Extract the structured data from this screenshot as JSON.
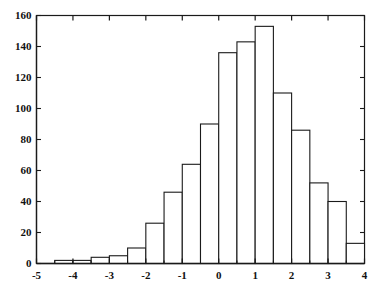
{
  "figure": {
    "title": "",
    "background_color": "#ffffff",
    "axis_color": "#1a1a1a",
    "bar_fill_color": "#ffffff",
    "bar_edge_color": "#1a1a1a",
    "tick_label_color": "#111111"
  },
  "chart_data": {
    "type": "bar",
    "chart_style": "histogram",
    "title": "",
    "subtitle": "",
    "xlabel": "",
    "ylabel": "",
    "xlim": [
      -5,
      4
    ],
    "ylim": [
      0,
      160
    ],
    "grid": false,
    "legend": false,
    "legend_entries": [],
    "annotations": [],
    "bin_width": 0.5,
    "xticks": [
      -5,
      -4,
      -3,
      -2,
      -1,
      0,
      1,
      2,
      3,
      4
    ],
    "xtick_labels": [
      "-5",
      "-4",
      "-3",
      "-2",
      "-1",
      "0",
      "1",
      "2",
      "3",
      "4"
    ],
    "yticks": [
      0,
      20,
      40,
      60,
      80,
      100,
      120,
      140,
      160
    ],
    "ytick_labels": [
      "0",
      "20",
      "40",
      "60",
      "80",
      "100",
      "120",
      "140",
      "160"
    ],
    "minor_xticks_per_major": 2,
    "bin_edges": [
      -4.5,
      -4.0,
      -3.5,
      -3.0,
      -2.5,
      -2.0,
      -1.5,
      -1.0,
      -0.5,
      0.0,
      0.5,
      1.0,
      1.5,
      2.0,
      2.5,
      3.0,
      3.5,
      4.0
    ],
    "categories": [
      "-4.5",
      "-4.0",
      "-3.5",
      "-3.0",
      "-2.5",
      "-2.0",
      "-1.5",
      "-1.0",
      "-0.5",
      "0.0",
      "0.5",
      "1.0",
      "1.5",
      "2.0",
      "2.5",
      "3.0",
      "3.5"
    ],
    "bins": [
      {
        "left": -4.5,
        "right": -4.0,
        "count": 2
      },
      {
        "left": -4.0,
        "right": -3.5,
        "count": 2
      },
      {
        "left": -3.5,
        "right": -3.0,
        "count": 4
      },
      {
        "left": -3.0,
        "right": -2.5,
        "count": 5
      },
      {
        "left": -2.5,
        "right": -2.0,
        "count": 10
      },
      {
        "left": -2.0,
        "right": -1.5,
        "count": 26
      },
      {
        "left": -1.5,
        "right": -1.0,
        "count": 46
      },
      {
        "left": -1.0,
        "right": -0.5,
        "count": 64
      },
      {
        "left": -0.5,
        "right": 0.0,
        "count": 90
      },
      {
        "left": 0.0,
        "right": 0.5,
        "count": 136
      },
      {
        "left": 0.5,
        "right": 1.0,
        "count": 143
      },
      {
        "left": 1.0,
        "right": 1.5,
        "count": 153
      },
      {
        "left": 1.5,
        "right": 2.0,
        "count": 110
      },
      {
        "left": 2.0,
        "right": 2.5,
        "count": 86
      },
      {
        "left": 2.5,
        "right": 3.0,
        "count": 52
      },
      {
        "left": 3.0,
        "right": 3.5,
        "count": 40
      },
      {
        "left": 3.5,
        "right": 4.0,
        "count": 13
      }
    ],
    "values": [
      2,
      2,
      4,
      5,
      10,
      26,
      46,
      64,
      90,
      136,
      143,
      153,
      110,
      86,
      52,
      40,
      13
    ],
    "extra_bins_note": "",
    "total_count": 922
  }
}
